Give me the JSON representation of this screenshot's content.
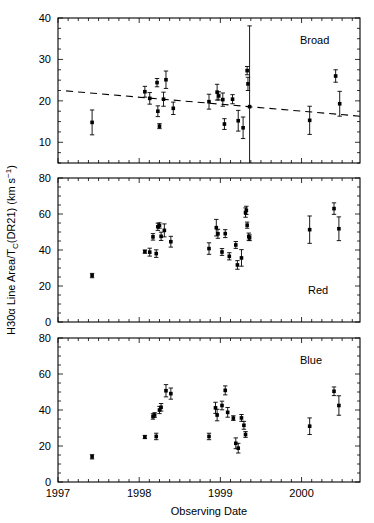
{
  "chart_data": {
    "type": "scatter",
    "title": "",
    "xlabel": "Observing Date",
    "ylabel": "H30α Line Area/T_C(DR21)  (km s⁻¹)",
    "xlim": [
      1997.0,
      2000.72
    ],
    "xticks_major": [
      1997,
      1998,
      1999,
      2000
    ],
    "xticklabels": [
      "1997",
      "1998",
      "1999",
      "2000"
    ],
    "xminor_step": 0.125,
    "grid": false,
    "legend": "none",
    "marker": "filled-square",
    "errorbars": "vertical",
    "panels": [
      {
        "id": "broad",
        "label": "Broad",
        "ylim": [
          5,
          40
        ],
        "yticks": [
          10,
          20,
          30,
          40
        ],
        "yticklabels": [
          "10",
          "20",
          "30",
          "40"
        ],
        "yminor_step": 2.5,
        "fit_line": {
          "style": "dashed",
          "x": [
            1997.1,
            2000.72
          ],
          "y": [
            22.4,
            16.3
          ]
        },
        "points": [
          {
            "x": 1997.42,
            "y": 14.8,
            "err": 3.0
          },
          {
            "x": 1998.07,
            "y": 22.2,
            "err": 1.3
          },
          {
            "x": 1998.13,
            "y": 20.6,
            "err": 1.4
          },
          {
            "x": 1998.22,
            "y": 24.4,
            "err": 1.0
          },
          {
            "x": 1998.23,
            "y": 17.5,
            "err": 1.3
          },
          {
            "x": 1998.25,
            "y": 13.9,
            "err": 0.6
          },
          {
            "x": 1998.3,
            "y": 20.4,
            "err": 1.7
          },
          {
            "x": 1998.33,
            "y": 25.1,
            "err": 2.1
          },
          {
            "x": 1998.42,
            "y": 18.2,
            "err": 1.5
          },
          {
            "x": 1998.86,
            "y": 19.8,
            "err": 1.8
          },
          {
            "x": 1998.96,
            "y": 22.1,
            "err": 1.9
          },
          {
            "x": 1998.98,
            "y": 21.2,
            "err": 1.0
          },
          {
            "x": 1999.03,
            "y": 20.3,
            "err": 1.6
          },
          {
            "x": 1999.05,
            "y": 14.4,
            "err": 1.3
          },
          {
            "x": 1999.15,
            "y": 20.4,
            "err": 1.1
          },
          {
            "x": 1999.22,
            "y": 15.2,
            "err": 2.5
          },
          {
            "x": 1999.28,
            "y": 13.5,
            "err": 2.6
          },
          {
            "x": 1999.33,
            "y": 27.3,
            "err": 1.0
          },
          {
            "x": 1999.34,
            "y": 24.1,
            "err": 1.6
          },
          {
            "x": 1999.36,
            "y": 18.6,
            "err": 19.5
          },
          {
            "x": 2000.1,
            "y": 15.3,
            "err": 3.4
          },
          {
            "x": 2000.42,
            "y": 26.0,
            "err": 1.5
          },
          {
            "x": 2000.47,
            "y": 19.3,
            "err": 3.0
          }
        ]
      },
      {
        "id": "red",
        "label": "Red",
        "ylim": [
          0,
          80
        ],
        "yticks": [
          0,
          20,
          40,
          60,
          80
        ],
        "yticklabels": [
          "0",
          "20",
          "40",
          "60",
          "80"
        ],
        "yminor_step": 5,
        "fit_line": null,
        "points": [
          {
            "x": 1997.42,
            "y": 25.8,
            "err": 1.2
          },
          {
            "x": 1998.07,
            "y": 39.1,
            "err": 0.9
          },
          {
            "x": 1998.13,
            "y": 38.8,
            "err": 2.2
          },
          {
            "x": 1998.17,
            "y": 47.3,
            "err": 1.8
          },
          {
            "x": 1998.21,
            "y": 38.0,
            "err": 2.1
          },
          {
            "x": 1998.23,
            "y": 52.9,
            "err": 2.0
          },
          {
            "x": 1998.25,
            "y": 53.6,
            "err": 1.5
          },
          {
            "x": 1998.27,
            "y": 47.6,
            "err": 2.3
          },
          {
            "x": 1998.31,
            "y": 50.9,
            "err": 3.6
          },
          {
            "x": 1998.39,
            "y": 44.6,
            "err": 3.0
          },
          {
            "x": 1998.86,
            "y": 40.8,
            "err": 3.2
          },
          {
            "x": 1998.95,
            "y": 52.4,
            "err": 4.6
          },
          {
            "x": 1998.97,
            "y": 49.0,
            "err": 2.5
          },
          {
            "x": 1999.02,
            "y": 38.9,
            "err": 1.9
          },
          {
            "x": 1999.06,
            "y": 49.1,
            "err": 2.2
          },
          {
            "x": 1999.11,
            "y": 36.5,
            "err": 2.0
          },
          {
            "x": 1999.19,
            "y": 42.8,
            "err": 1.9
          },
          {
            "x": 1999.21,
            "y": 31.7,
            "err": 2.4
          },
          {
            "x": 1999.26,
            "y": 35.6,
            "err": 4.6
          },
          {
            "x": 1999.31,
            "y": 60.8,
            "err": 2.6
          },
          {
            "x": 1999.32,
            "y": 62.0,
            "err": 2.3
          },
          {
            "x": 1999.33,
            "y": 53.8,
            "err": 1.7
          },
          {
            "x": 1999.35,
            "y": 47.4,
            "err": 2.0
          },
          {
            "x": 1999.36,
            "y": 46.8,
            "err": 1.6
          },
          {
            "x": 2000.1,
            "y": 51.3,
            "err": 7.6
          },
          {
            "x": 2000.4,
            "y": 63.0,
            "err": 3.2
          },
          {
            "x": 2000.46,
            "y": 51.8,
            "err": 6.6
          }
        ]
      },
      {
        "id": "blue",
        "label": "Blue",
        "ylim": [
          0,
          80
        ],
        "yticks": [
          0,
          20,
          40,
          60,
          80
        ],
        "yticklabels": [
          "0",
          "20",
          "40",
          "60",
          "80"
        ],
        "yminor_step": 5,
        "fit_line": null,
        "points": [
          {
            "x": 1997.42,
            "y": 14.0,
            "err": 1.2
          },
          {
            "x": 1998.07,
            "y": 25.0,
            "err": 0.9
          },
          {
            "x": 1998.17,
            "y": 36.4,
            "err": 1.5
          },
          {
            "x": 1998.19,
            "y": 37.2,
            "err": 1.3
          },
          {
            "x": 1998.21,
            "y": 25.3,
            "err": 1.8
          },
          {
            "x": 1998.25,
            "y": 40.0,
            "err": 2.0
          },
          {
            "x": 1998.27,
            "y": 41.5,
            "err": 2.1
          },
          {
            "x": 1998.33,
            "y": 50.7,
            "err": 3.4
          },
          {
            "x": 1998.39,
            "y": 49.1,
            "err": 3.1
          },
          {
            "x": 1998.86,
            "y": 25.3,
            "err": 1.8
          },
          {
            "x": 1998.94,
            "y": 41.2,
            "err": 3.1
          },
          {
            "x": 1998.96,
            "y": 37.2,
            "err": 3.2
          },
          {
            "x": 1999.02,
            "y": 42.5,
            "err": 2.4
          },
          {
            "x": 1999.06,
            "y": 50.9,
            "err": 2.5
          },
          {
            "x": 1999.09,
            "y": 38.7,
            "err": 2.7
          },
          {
            "x": 1999.16,
            "y": 35.5,
            "err": 1.3
          },
          {
            "x": 1999.19,
            "y": 21.5,
            "err": 3.0
          },
          {
            "x": 1999.22,
            "y": 18.8,
            "err": 2.7
          },
          {
            "x": 1999.26,
            "y": 35.6,
            "err": 1.9
          },
          {
            "x": 1999.29,
            "y": 31.5,
            "err": 2.2
          },
          {
            "x": 1999.31,
            "y": 26.4,
            "err": 1.6
          },
          {
            "x": 2000.1,
            "y": 31.0,
            "err": 4.6
          },
          {
            "x": 2000.4,
            "y": 50.4,
            "err": 2.4
          },
          {
            "x": 2000.46,
            "y": 42.5,
            "err": 5.4
          }
        ]
      }
    ]
  },
  "figure": {
    "xaxis_title": "Observing Date",
    "yaxis_title": "H30α Line Area/T",
    "yaxis_title_sub": "C",
    "yaxis_title_rest": "(DR21)  (km s",
    "yaxis_title_sup": "−1",
    "yaxis_title_end": ")",
    "panel_labels": [
      "Broad",
      "Red",
      "Blue"
    ]
  }
}
